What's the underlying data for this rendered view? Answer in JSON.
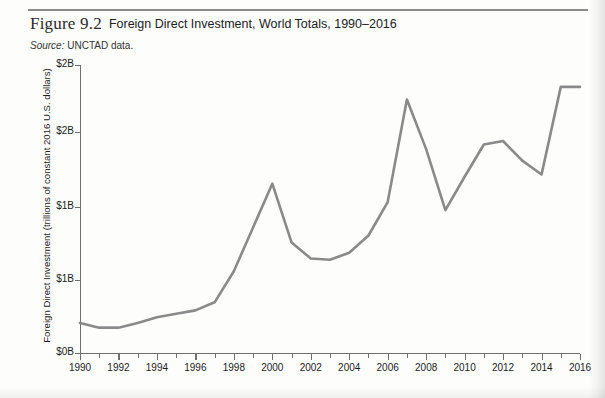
{
  "figure": {
    "number": "Figure 9.2",
    "title": "Foreign Direct Investment, World Totals, 1990–2016",
    "source_label": "Source:",
    "source_text": " UNCTAD data."
  },
  "colors": {
    "line": "#8a8a8a",
    "axis": "#6f6f6f",
    "text": "#1c1c1c",
    "rule": "#8a8a8a",
    "page": "#fdfdfc"
  },
  "chart_data": {
    "type": "line",
    "title": "Foreign Direct Investment, World Totals, 1990–2016",
    "xlabel": "",
    "ylabel": "Foreign Direct Investment (trillions of constant 2016 U.S. dollars)",
    "source": "UNCTAD data.",
    "xlim": [
      1990,
      2016
    ],
    "ylim": [
      0,
      2.5
    ],
    "grid": false,
    "legend": "none",
    "y_ticks": [
      0,
      0.625,
      1.25,
      1.875,
      2.5
    ],
    "y_tick_labels": [
      "$0B",
      "$1B",
      "$1B",
      "$2B",
      "$2B"
    ],
    "x_ticks": [
      1990,
      1992,
      1994,
      1996,
      1998,
      2000,
      2002,
      2004,
      2006,
      2008,
      2010,
      2012,
      2014,
      2016
    ],
    "x_tick_labels": [
      "1990",
      "1992",
      "1994",
      "1996",
      "1998",
      "2000",
      "2002",
      "2004",
      "2006",
      "2008",
      "2010",
      "2012",
      "2014",
      "2016"
    ],
    "x_minor_ticks": [
      1991,
      1993,
      1995,
      1997,
      1999,
      2001,
      2003,
      2005,
      2007,
      2009,
      2011,
      2013,
      2015
    ],
    "x": [
      1990,
      1991,
      1992,
      1993,
      1994,
      1995,
      1996,
      1997,
      1998,
      1999,
      2000,
      2001,
      2002,
      2003,
      2004,
      2005,
      2006,
      2007,
      2008,
      2009,
      2010,
      2011,
      2012,
      2013,
      2014,
      2015,
      2016
    ],
    "series": [
      {
        "name": "Foreign Direct Investment",
        "values": [
          0.26,
          0.22,
          0.22,
          0.26,
          0.31,
          0.34,
          0.37,
          0.44,
          0.71,
          1.09,
          1.47,
          0.96,
          0.82,
          0.81,
          0.87,
          1.02,
          1.31,
          2.2,
          1.77,
          1.24,
          1.53,
          1.81,
          1.84,
          1.67,
          1.55,
          2.31,
          2.31
        ]
      }
    ]
  },
  "y_axis_labels": [
    {
      "text": "$2B",
      "y": 65
    },
    {
      "text": "$2B",
      "y": 132
    },
    {
      "text": "$1B",
      "y": 207
    },
    {
      "text": "$1B",
      "y": 280
    },
    {
      "text": "$0B",
      "y": 353
    }
  ]
}
